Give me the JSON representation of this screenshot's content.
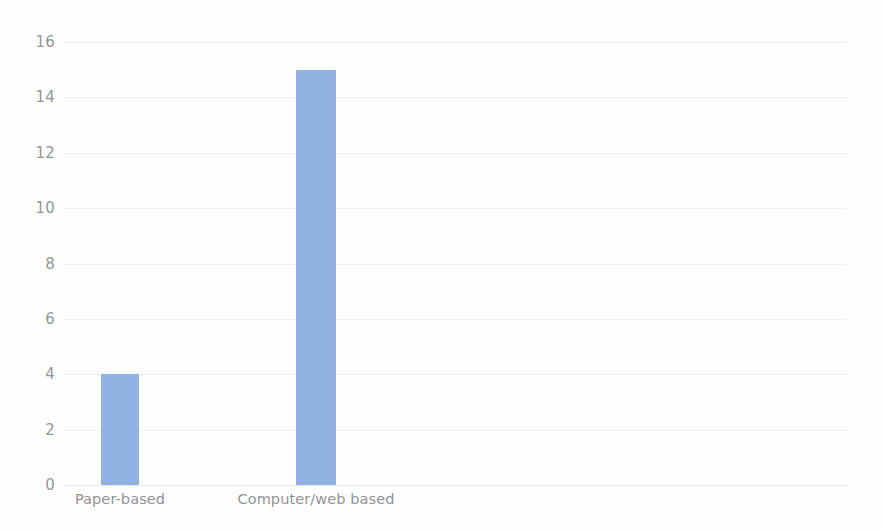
{
  "chart_data": {
    "type": "bar",
    "title": "",
    "subtitle": "",
    "xlabel": "",
    "ylabel": "",
    "categories": [
      "Paper-based",
      "Computer/web based"
    ],
    "values": [
      4,
      15
    ],
    "series": [
      {
        "name": "Count",
        "values": [
          4,
          15
        ],
        "color": "#7ba3dc"
      }
    ],
    "ylim": [
      0,
      16
    ],
    "y_ticks": [
      0,
      2,
      4,
      6,
      8,
      10,
      12,
      14,
      16
    ],
    "y_tick_labels": [
      "0",
      "2",
      "4",
      "6",
      "8",
      "10",
      "12",
      "14",
      "16"
    ],
    "grid": true,
    "grid_axis": "y",
    "legend": false,
    "legend_position": "none",
    "annotations": [],
    "colors": {
      "bar": "#7ba3dc",
      "gridline": "#ededf0",
      "tick_label": "#808080",
      "background": "#ffffff"
    }
  }
}
